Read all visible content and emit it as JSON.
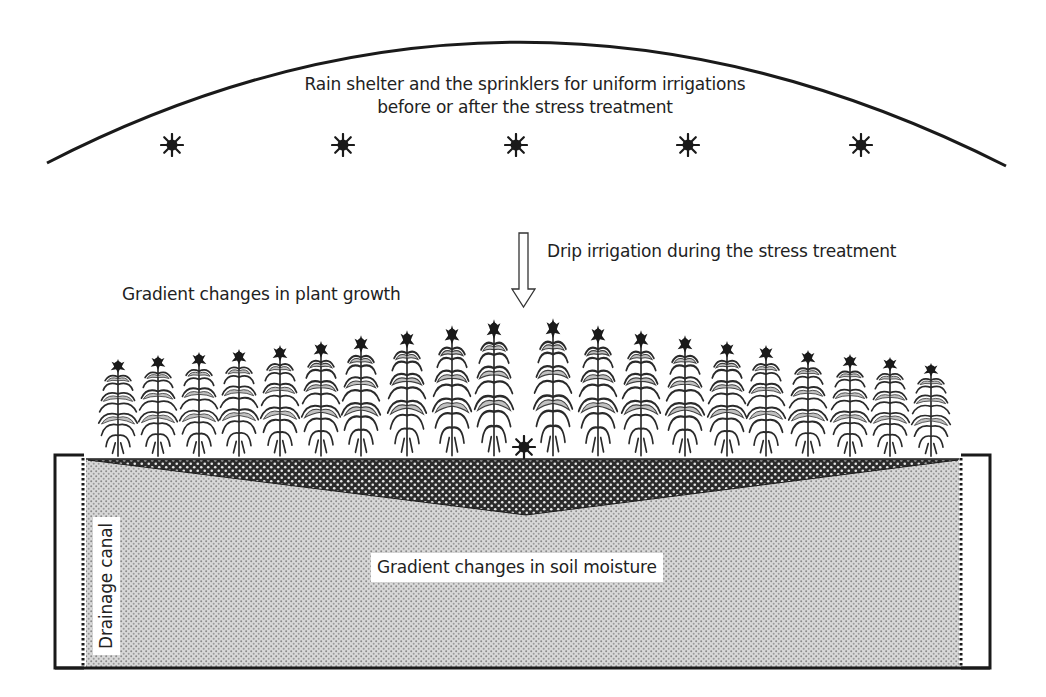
{
  "diagram": {
    "shelter": {
      "label_line1": "Rain shelter and the sprinklers for uniform irrigations",
      "label_line2": "before or after the stress treatment",
      "sprinkler_count": 5,
      "sprinkler_icon": "asterisk-burst-icon",
      "sprinkler_x": [
        172,
        343,
        516,
        688,
        861
      ],
      "sprinkler_y": 145
    },
    "drip": {
      "label": "Drip irrigation during the stress treatment",
      "arrow_icon": "hollow-down-arrow-icon",
      "arrow_x": 524,
      "sprinkler_x": 524,
      "sprinkler_y": 447
    },
    "plants": {
      "label": "Gradient changes in plant growth",
      "count": 20,
      "icon": "corn-plant-icon",
      "x": [
        118,
        158,
        199,
        239,
        280,
        321,
        361,
        407,
        452,
        494,
        553,
        598,
        641,
        685,
        727,
        766,
        808,
        850,
        890,
        931
      ],
      "top_y": [
        358,
        354,
        351,
        348,
        344,
        340,
        334,
        329,
        324,
        318,
        317,
        324,
        329,
        334,
        340,
        344,
        349,
        353,
        356,
        362
      ],
      "ground_y": 458
    },
    "soil": {
      "label": "Gradient changes in soil moisture",
      "wet_zone_color": "#2a2a2a",
      "dry_zone_color": "#bdbdbd"
    },
    "drainage": {
      "label": "Drainage canal"
    },
    "colors": {
      "line": "#1a1a1a",
      "background": "#ffffff"
    }
  }
}
